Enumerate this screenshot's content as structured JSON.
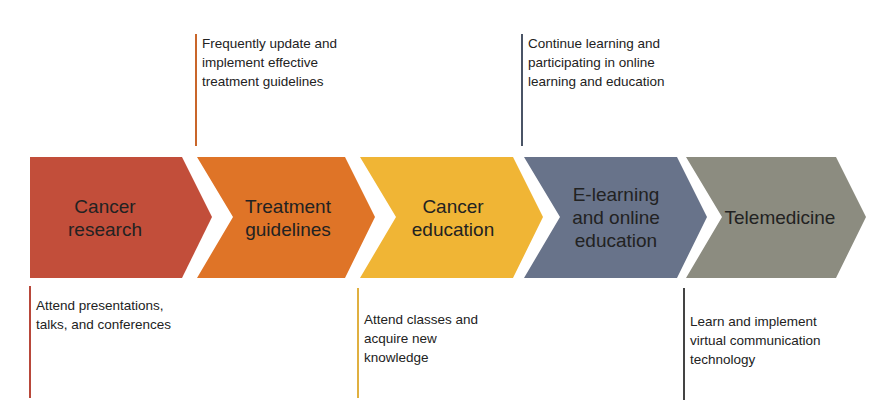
{
  "stages": [
    {
      "label": "Cancer research",
      "lines": [
        "Cancer",
        "research"
      ],
      "color": "#c24e3a"
    },
    {
      "label": "Treatment guidelines",
      "lines": [
        "Treatment",
        "guidelines"
      ],
      "color": "#df7427"
    },
    {
      "label": "Cancer education",
      "lines": [
        "Cancer",
        "education"
      ],
      "color": "#f0b535"
    },
    {
      "label": "E-learning and online education",
      "lines": [
        "E-learning",
        "and online",
        "education"
      ],
      "color": "#68738a"
    },
    {
      "label": "Telemedicine",
      "lines": [
        "Telemedicine"
      ],
      "color": "#8c8c80"
    }
  ],
  "notes_top": [
    {
      "stage": "Treatment guidelines",
      "lines": [
        "Frequently update and",
        "implement effective",
        "treatment guidelines"
      ],
      "color": "#c9662a"
    },
    {
      "stage": "E-learning and online education",
      "lines": [
        "Continue learning and",
        "participating in online",
        "learning and education"
      ],
      "color": "#4a5466"
    }
  ],
  "notes_bottom": [
    {
      "stage": "Cancer research",
      "lines": [
        "Attend presentations,",
        "talks, and conferences"
      ],
      "color": "#b8483a"
    },
    {
      "stage": "Cancer education",
      "lines": [
        "Attend classes and",
        "acquire new",
        "knowledge"
      ],
      "color": "#e0b040"
    },
    {
      "stage": "Telemedicine",
      "lines": [
        "Learn and implement",
        "virtual communication",
        "technology"
      ],
      "color": "#444444"
    }
  ]
}
